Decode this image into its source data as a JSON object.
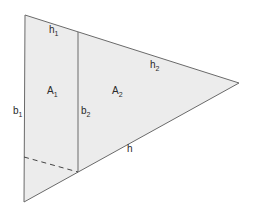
{
  "diagram": {
    "type": "geometry",
    "colors": {
      "fill": "#ececec",
      "stroke": "#6a6a6a",
      "text": "#2a2a2a",
      "background": "#ffffff"
    },
    "shapes": {
      "outer_triangle": {
        "vertices": [
          [
            25,
            15
          ],
          [
            24,
            202
          ],
          [
            239,
            83
          ]
        ]
      },
      "divider": {
        "x1": 78,
        "y1": 32,
        "x2": 78,
        "y2": 172
      },
      "dashed_line": {
        "x1": 24,
        "y1": 157,
        "x2": 78,
        "y2": 172
      }
    },
    "labels": {
      "h1": {
        "base": "h",
        "sub": "1"
      },
      "h2": {
        "base": "h",
        "sub": "2"
      },
      "h": {
        "base": "h",
        "sub": ""
      },
      "A1": {
        "base": "A",
        "sub": "1"
      },
      "A2": {
        "base": "A",
        "sub": "2"
      },
      "b1": {
        "base": "b",
        "sub": "1"
      },
      "b2": {
        "base": "b",
        "sub": "2"
      }
    }
  }
}
